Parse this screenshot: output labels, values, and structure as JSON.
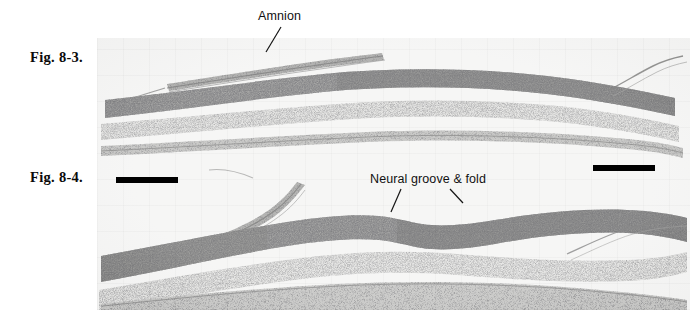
{
  "plate": {
    "width": 695,
    "height": 327,
    "background_color": "#ffffff",
    "kind": "histology-figure-plate"
  },
  "figures": [
    {
      "id": "fig-8-3",
      "label": "Fig. 8-3.",
      "caption_position": "left-margin",
      "annotations": [
        {
          "id": "amnion",
          "label": "Amnion",
          "leader_lines": 1
        }
      ],
      "scale_bars": [
        {
          "id": "scale-bar-right",
          "position": "bottom-right"
        }
      ]
    },
    {
      "id": "fig-8-4",
      "label": "Fig. 8-4.",
      "caption_position": "left-margin",
      "annotations": [
        {
          "id": "neural-groove-fold",
          "label": "Neural groove & fold",
          "leader_lines": 2
        }
      ],
      "scale_bars": [
        {
          "id": "scale-bar-left",
          "position": "top-left"
        }
      ]
    }
  ],
  "micrograph": {
    "description": "Light micrograph of two transverse sections of an early embryo showing the neural plate, neural groove and fold, and overlying amnion",
    "stain_tone": "#f3f3f2",
    "ink_color": "#1a1a1a",
    "sections": [
      {
        "id": "upper-section",
        "figure": "fig-8-3"
      },
      {
        "id": "lower-section",
        "figure": "fig-8-4"
      }
    ]
  },
  "colors": {
    "page_background": "#ffffff",
    "print_background": "#f3f3f2",
    "text": "#111111",
    "scale_bar": "#000000",
    "leader_line": "#141414"
  }
}
